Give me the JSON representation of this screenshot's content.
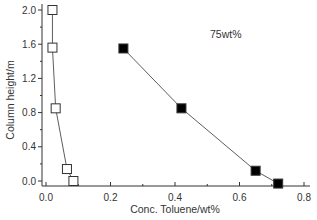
{
  "chart_data": {
    "type": "line",
    "title": "",
    "annotation": "75wt%",
    "xlabel": "Conc. Toluene/wt%",
    "ylabel": "Column height/m",
    "xlim": [
      0.0,
      0.8
    ],
    "ylim": [
      -0.05,
      2.05
    ],
    "xticks": [
      0.0,
      0.2,
      0.4,
      0.6,
      0.8
    ],
    "xtick_labels": [
      "0.0",
      "0.2",
      "0.4",
      "0.6",
      "0.8"
    ],
    "yticks": [
      0.0,
      0.4,
      0.8,
      1.2,
      1.6,
      2.0
    ],
    "ytick_labels": [
      "0.0",
      "0.4",
      "0.8",
      "1.2",
      "1.6",
      "2.0"
    ],
    "grid": false,
    "legend": null,
    "series": [
      {
        "name": "open squares",
        "marker": "open-square",
        "color": "#000000",
        "x": [
          0.02,
          0.02,
          0.03,
          0.065,
          0.085
        ],
        "y": [
          2.0,
          1.56,
          0.85,
          0.14,
          0.0
        ]
      },
      {
        "name": "filled squares",
        "marker": "filled-square",
        "color": "#000000",
        "x": [
          0.24,
          0.42,
          0.65,
          0.72
        ],
        "y": [
          1.55,
          0.85,
          0.12,
          -0.03
        ]
      }
    ]
  }
}
